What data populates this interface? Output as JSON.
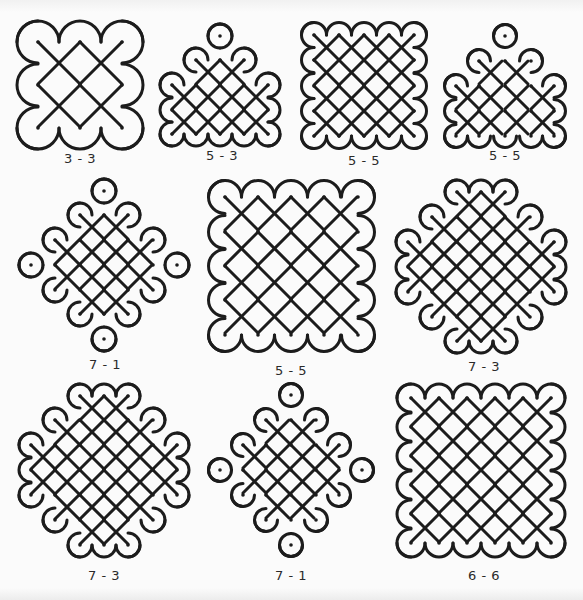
{
  "page": {
    "colors": {
      "line": "#1c1c1c",
      "background": "#fbfbfb",
      "caption": "#2a2a2a"
    }
  },
  "figures": [
    {
      "id": "fig-1",
      "caption": "3 - 3",
      "row": 1,
      "dot_grid": [
        [
          1,
          1,
          1
        ],
        [
          1,
          1,
          1
        ],
        [
          1,
          1,
          1
        ]
      ],
      "box": {
        "x": 15,
        "y": 20,
        "w": 140,
        "h": 130
      },
      "caption_pos": {
        "x": 80,
        "y": 160
      },
      "dots": [
        [
          38,
          42
        ],
        [
          80,
          42
        ],
        [
          122,
          42
        ],
        [
          38,
          85
        ],
        [
          80,
          85
        ],
        [
          122,
          85
        ],
        [
          38,
          128
        ],
        [
          80,
          128
        ],
        [
          122,
          128
        ]
      ],
      "loops": [
        [
          38,
          42,
          "circle"
        ],
        [
          80,
          85,
          "circle"
        ],
        [
          122,
          128,
          "circle"
        ]
      ],
      "links": [
        [
          [
            80,
            42
          ],
          [
            122,
            42
          ]
        ],
        [
          [
            122,
            42
          ],
          [
            122,
            85
          ]
        ],
        [
          [
            38,
            85
          ],
          [
            38,
            128
          ]
        ],
        [
          [
            38,
            128
          ],
          [
            80,
            128
          ]
        ]
      ]
    },
    {
      "id": "fig-2",
      "caption": "5 - 3",
      "row": 1,
      "box": {
        "x": 165,
        "y": 20,
        "w": 125,
        "h": 120
      },
      "caption_pos": {
        "x": 222,
        "y": 157
      },
      "dots": [
        [
          220,
          36
        ],
        [
          196,
          60
        ],
        [
          220,
          60
        ],
        [
          244,
          60
        ],
        [
          220,
          85
        ],
        [
          172,
          85
        ],
        [
          196,
          85
        ],
        [
          244,
          85
        ],
        [
          268,
          85
        ],
        [
          172,
          110
        ],
        [
          196,
          110
        ],
        [
          220,
          110
        ],
        [
          244,
          110
        ],
        [
          268,
          110
        ],
        [
          172,
          134
        ],
        [
          196,
          134
        ],
        [
          220,
          134
        ],
        [
          244,
          134
        ],
        [
          268,
          134
        ]
      ]
    },
    {
      "id": "fig-3",
      "caption": "5 - 5",
      "row": 1,
      "box": {
        "x": 300,
        "y": 20,
        "w": 135,
        "h": 125
      },
      "caption_pos": {
        "x": 364,
        "y": 162
      },
      "dots": [
        [
          314,
          35
        ],
        [
          339,
          35
        ],
        [
          364,
          35
        ],
        [
          389,
          35
        ],
        [
          414,
          35
        ],
        [
          314,
          60
        ],
        [
          339,
          60
        ],
        [
          364,
          60
        ],
        [
          389,
          60
        ],
        [
          414,
          60
        ],
        [
          314,
          86
        ],
        [
          339,
          86
        ],
        [
          364,
          86
        ],
        [
          389,
          86
        ],
        [
          414,
          86
        ],
        [
          314,
          111
        ],
        [
          339,
          111
        ],
        [
          364,
          111
        ],
        [
          389,
          111
        ],
        [
          414,
          111
        ],
        [
          314,
          136
        ],
        [
          339,
          136
        ],
        [
          364,
          136
        ],
        [
          389,
          136
        ],
        [
          414,
          136
        ]
      ]
    },
    {
      "id": "fig-4",
      "caption": "5 - 5",
      "row": 1,
      "box": {
        "x": 440,
        "y": 20,
        "w": 140,
        "h": 125
      },
      "caption_pos": {
        "x": 505,
        "y": 157
      },
      "dots": [
        [
          505,
          36
        ],
        [
          479,
          61
        ],
        [
          505,
          61
        ],
        [
          531,
          61
        ],
        [
          456,
          86
        ],
        [
          479,
          86
        ],
        [
          505,
          86
        ],
        [
          531,
          86
        ],
        [
          554,
          86
        ],
        [
          456,
          111
        ],
        [
          479,
          111
        ],
        [
          505,
          111
        ],
        [
          531,
          111
        ],
        [
          554,
          111
        ],
        [
          456,
          136
        ],
        [
          479,
          136
        ],
        [
          505,
          136
        ],
        [
          531,
          136
        ],
        [
          554,
          136
        ]
      ]
    },
    {
      "id": "fig-5",
      "caption": "7 - 1",
      "row": 2,
      "box": {
        "x": 20,
        "y": 180,
        "w": 175,
        "h": 170
      },
      "caption_pos": {
        "x": 105,
        "y": 366
      },
      "dots": [
        [
          104,
          191
        ],
        [
          80,
          215
        ],
        [
          104,
          215
        ],
        [
          128,
          215
        ],
        [
          80,
          240
        ],
        [
          104,
          240
        ],
        [
          128,
          240
        ],
        [
          55,
          240
        ],
        [
          153,
          240
        ],
        [
          31,
          265
        ],
        [
          55,
          265
        ],
        [
          80,
          265
        ],
        [
          104,
          265
        ],
        [
          128,
          265
        ],
        [
          153,
          265
        ],
        [
          177,
          265
        ],
        [
          55,
          290
        ],
        [
          153,
          290
        ],
        [
          80,
          290
        ],
        [
          104,
          290
        ],
        [
          128,
          290
        ],
        [
          80,
          314
        ],
        [
          104,
          314
        ],
        [
          128,
          314
        ],
        [
          104,
          339
        ]
      ]
    },
    {
      "id": "fig-6",
      "caption": "5 - 5",
      "row": 2,
      "box": {
        "x": 210,
        "y": 185,
        "w": 170,
        "h": 165
      },
      "caption_pos": {
        "x": 291,
        "y": 372
      },
      "dots": [
        [
          225,
          197
        ],
        [
          258,
          197
        ],
        [
          291,
          197
        ],
        [
          324,
          197
        ],
        [
          358,
          197
        ],
        [
          225,
          232
        ],
        [
          258,
          232
        ],
        [
          291,
          232
        ],
        [
          324,
          232
        ],
        [
          358,
          232
        ],
        [
          225,
          266
        ],
        [
          258,
          266
        ],
        [
          291,
          266
        ],
        [
          324,
          266
        ],
        [
          358,
          266
        ],
        [
          225,
          300
        ],
        [
          258,
          300
        ],
        [
          291,
          300
        ],
        [
          324,
          300
        ],
        [
          358,
          300
        ],
        [
          225,
          335
        ],
        [
          258,
          335
        ],
        [
          291,
          335
        ],
        [
          324,
          335
        ],
        [
          358,
          335
        ]
      ]
    },
    {
      "id": "fig-7",
      "caption": "7 - 3",
      "row": 2,
      "box": {
        "x": 395,
        "y": 180,
        "w": 180,
        "h": 175
      },
      "caption_pos": {
        "x": 484,
        "y": 368
      },
      "dots": [
        [
          457,
          192
        ],
        [
          481,
          192
        ],
        [
          505,
          192
        ],
        [
          432,
          217
        ],
        [
          457,
          217
        ],
        [
          481,
          217
        ],
        [
          505,
          217
        ],
        [
          530,
          217
        ],
        [
          408,
          242
        ],
        [
          432,
          242
        ],
        [
          457,
          242
        ],
        [
          481,
          242
        ],
        [
          505,
          242
        ],
        [
          530,
          242
        ],
        [
          554,
          242
        ],
        [
          408,
          267
        ],
        [
          432,
          267
        ],
        [
          457,
          267
        ],
        [
          481,
          267
        ],
        [
          505,
          267
        ],
        [
          530,
          267
        ],
        [
          554,
          267
        ],
        [
          408,
          292
        ],
        [
          432,
          292
        ],
        [
          457,
          292
        ],
        [
          481,
          292
        ],
        [
          505,
          292
        ],
        [
          530,
          292
        ],
        [
          554,
          292
        ],
        [
          432,
          317
        ],
        [
          457,
          317
        ],
        [
          481,
          317
        ],
        [
          505,
          317
        ],
        [
          530,
          317
        ],
        [
          457,
          341
        ],
        [
          481,
          341
        ],
        [
          505,
          341
        ]
      ]
    },
    {
      "id": "fig-8",
      "caption": "7 - 3",
      "row": 3,
      "box": {
        "x": 20,
        "y": 385,
        "w": 185,
        "h": 180
      },
      "caption_pos": {
        "x": 104,
        "y": 577
      },
      "dots": [
        [
          80,
          396
        ],
        [
          104,
          396
        ],
        [
          128,
          396
        ],
        [
          55,
          420
        ],
        [
          80,
          420
        ],
        [
          104,
          420
        ],
        [
          128,
          420
        ],
        [
          153,
          420
        ],
        [
          31,
          445
        ],
        [
          55,
          445
        ],
        [
          80,
          445
        ],
        [
          104,
          445
        ],
        [
          128,
          445
        ],
        [
          153,
          445
        ],
        [
          177,
          445
        ],
        [
          31,
          470
        ],
        [
          55,
          470
        ],
        [
          80,
          470
        ],
        [
          104,
          470
        ],
        [
          128,
          470
        ],
        [
          153,
          470
        ],
        [
          177,
          470
        ],
        [
          31,
          495
        ],
        [
          55,
          495
        ],
        [
          80,
          495
        ],
        [
          104,
          495
        ],
        [
          128,
          495
        ],
        [
          153,
          495
        ],
        [
          177,
          495
        ],
        [
          55,
          520
        ],
        [
          80,
          520
        ],
        [
          104,
          520
        ],
        [
          128,
          520
        ],
        [
          153,
          520
        ],
        [
          80,
          545
        ],
        [
          104,
          545
        ],
        [
          128,
          545
        ]
      ]
    },
    {
      "id": "fig-9",
      "caption": "7 - 1",
      "row": 3,
      "box": {
        "x": 210,
        "y": 385,
        "w": 165,
        "h": 175
      },
      "caption_pos": {
        "x": 291,
        "y": 577
      },
      "dots": [
        [
          291,
          395
        ],
        [
          266,
          420
        ],
        [
          291,
          420
        ],
        [
          316,
          420
        ],
        [
          243,
          445
        ],
        [
          266,
          445
        ],
        [
          291,
          445
        ],
        [
          316,
          445
        ],
        [
          339,
          445
        ],
        [
          220,
          470
        ],
        [
          243,
          470
        ],
        [
          266,
          470
        ],
        [
          291,
          470
        ],
        [
          316,
          470
        ],
        [
          339,
          470
        ],
        [
          362,
          470
        ],
        [
          243,
          495
        ],
        [
          266,
          495
        ],
        [
          291,
          495
        ],
        [
          316,
          495
        ],
        [
          339,
          495
        ],
        [
          266,
          520
        ],
        [
          291,
          520
        ],
        [
          316,
          520
        ],
        [
          291,
          545
        ]
      ]
    },
    {
      "id": "fig-10",
      "caption": "6 - 6",
      "row": 3,
      "box": {
        "x": 395,
        "y": 385,
        "w": 180,
        "h": 175
      },
      "caption_pos": {
        "x": 484,
        "y": 577
      },
      "dots": [
        [
          411,
          398
        ],
        [
          439,
          398
        ],
        [
          467,
          398
        ],
        [
          495,
          398
        ],
        [
          523,
          398
        ],
        [
          551,
          398
        ],
        [
          411,
          427
        ],
        [
          439,
          427
        ],
        [
          467,
          427
        ],
        [
          495,
          427
        ],
        [
          523,
          427
        ],
        [
          551,
          427
        ],
        [
          411,
          456
        ],
        [
          439,
          456
        ],
        [
          467,
          456
        ],
        [
          495,
          456
        ],
        [
          523,
          456
        ],
        [
          551,
          456
        ],
        [
          411,
          485
        ],
        [
          439,
          485
        ],
        [
          467,
          485
        ],
        [
          495,
          485
        ],
        [
          523,
          485
        ],
        [
          551,
          485
        ],
        [
          411,
          514
        ],
        [
          439,
          514
        ],
        [
          467,
          514
        ],
        [
          495,
          514
        ],
        [
          523,
          514
        ],
        [
          551,
          514
        ],
        [
          411,
          543
        ],
        [
          439,
          543
        ],
        [
          467,
          543
        ],
        [
          495,
          543
        ],
        [
          523,
          543
        ],
        [
          551,
          543
        ]
      ]
    }
  ]
}
